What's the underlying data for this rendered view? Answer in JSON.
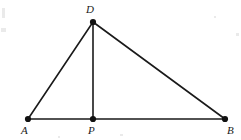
{
  "figure": {
    "background_color": "#ffffff",
    "stroke_color": "#1a1a1a",
    "label_color": "#1a1a1a",
    "points": [
      {
        "id": "D",
        "label": "D",
        "x": 93,
        "y": 22,
        "label_x": 86,
        "label_y": 4,
        "dot_radius": 3.1
      },
      {
        "id": "A",
        "label": "A",
        "x": 28,
        "y": 119,
        "label_x": 21,
        "label_y": 125,
        "dot_radius": 3.1
      },
      {
        "id": "P",
        "label": "P",
        "x": 93,
        "y": 119,
        "label_x": 88,
        "label_y": 125,
        "dot_radius": 3.1
      },
      {
        "id": "B",
        "label": "B",
        "x": 225,
        "y": 119,
        "label_x": 227,
        "label_y": 125,
        "dot_radius": 3.1
      }
    ],
    "segments": [
      {
        "id": "AB",
        "from": "A",
        "to": "B",
        "x1": 28,
        "y1": 119,
        "x2": 225,
        "y2": 119,
        "width": 1.4
      },
      {
        "id": "AD",
        "from": "A",
        "to": "D",
        "x1": 28,
        "y1": 119,
        "x2": 93,
        "y2": 22,
        "width": 1.6
      },
      {
        "id": "DB",
        "from": "D",
        "to": "B",
        "x1": 93,
        "y1": 22,
        "x2": 225,
        "y2": 119,
        "width": 1.6
      },
      {
        "id": "DP",
        "from": "D",
        "to": "P",
        "x1": 93,
        "y1": 22,
        "x2": 93,
        "y2": 119,
        "width": 1.6
      }
    ],
    "scan_flecks": [
      {
        "x": 2,
        "y": 8,
        "w": 3,
        "h": 10
      },
      {
        "x": 1,
        "y": 28,
        "w": 5,
        "h": 4
      },
      {
        "x": 236,
        "y": 33,
        "w": 3,
        "h": 3
      },
      {
        "x": 214,
        "y": 16,
        "w": 2,
        "h": 2
      },
      {
        "x": 120,
        "y": 134,
        "w": 3,
        "h": 2
      },
      {
        "x": 58,
        "y": 136,
        "w": 2,
        "h": 2
      }
    ]
  }
}
